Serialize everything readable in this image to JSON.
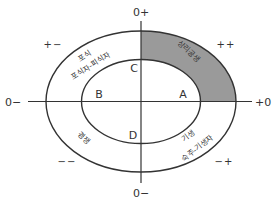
{
  "diagram": {
    "type": "symbiosis-interaction-ellipse",
    "colors": {
      "stroke": "#333333",
      "shaded_region": "#9a9a9a",
      "text": "#333333",
      "background": "#ffffff"
    },
    "axes": {
      "top": "0+",
      "bottom": "0−",
      "left": "0−",
      "right": "+0"
    },
    "quadrant_signs": {
      "top_left": "+−",
      "top_right": "++",
      "bottom_left": "−−",
      "bottom_right": "−+"
    },
    "inner_points": {
      "right": "A",
      "left": "B",
      "top": "C",
      "bottom": "D"
    },
    "ring_labels": {
      "top_left_line1": "포식",
      "top_left_line2": "포식자-피식자",
      "top_right": "상리공생",
      "bottom_left": "경쟁",
      "bottom_right_line1": "기생",
      "bottom_right_line2": "숙주-기생자"
    },
    "shaded_quadrant": "top_right"
  }
}
